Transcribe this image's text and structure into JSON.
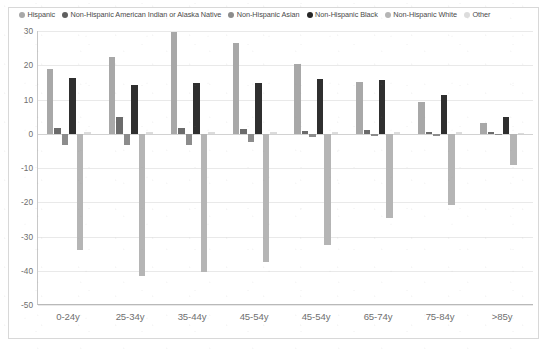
{
  "chart_data": {
    "type": "bar",
    "title": "",
    "subtitle": "",
    "xlabel": "",
    "ylabel": "",
    "ylim": [
      -50,
      30
    ],
    "yticks": [
      30,
      20,
      10,
      0,
      -10,
      -20,
      -30,
      -40,
      -50
    ],
    "ytick_labels": [
      "30",
      "20",
      "10",
      "0",
      "-10",
      "-20",
      "-30",
      "-40",
      "-50"
    ],
    "grid": true,
    "legend_position": "top",
    "categories": [
      "0-24y",
      "25-34y",
      "35-44y",
      "45-54y",
      "45-54y",
      "65-74y",
      "75-84y",
      ">85y"
    ],
    "series": [
      {
        "name": "Hispanic",
        "color": "#a8a8a8",
        "values": [
          19,
          22.5,
          29.8,
          26.5,
          20.3,
          15,
          9.2,
          3.2
        ]
      },
      {
        "name": "Non-Hispanic American Indian or Alaska Native",
        "color": "#6b6b6b",
        "values": [
          1.8,
          4.8,
          1.8,
          1.5,
          0.8,
          1.2,
          0.5,
          0.4
        ]
      },
      {
        "name": "Non-Hispanic Asian",
        "color": "#8c8c8c",
        "values": [
          -3.2,
          -3.2,
          -3.2,
          -2.4,
          -0.9,
          -0.8,
          -0.6,
          -0.5
        ]
      },
      {
        "name": "Non-Hispanic Black",
        "color": "#2f2f2f",
        "values": [
          16.4,
          14.2,
          14.8,
          14.8,
          16,
          15.6,
          11.3,
          5
        ]
      },
      {
        "name": "Non-Hispanic White",
        "color": "#b5b5b5",
        "values": [
          -33.8,
          -41.5,
          -40.5,
          -37.5,
          -32.5,
          -24.5,
          -20.8,
          -9.2
        ]
      },
      {
        "name": "Other",
        "color": "#dcdcdc",
        "values": [
          0.6,
          0.5,
          0.5,
          0.5,
          0.5,
          0.5,
          0.4,
          0.3
        ]
      }
    ]
  },
  "legend": {
    "items": [
      {
        "label": "Hispanic",
        "color": "#a8a8a8"
      },
      {
        "label": "Non-Hispanic American Indian or Alaska Native",
        "color": "#5f5f5f"
      },
      {
        "label": "Non-Hispanic Asian",
        "color": "#8c8c8c"
      },
      {
        "label": "Non-Hispanic Black",
        "color": "#262626"
      },
      {
        "label": "Non-Hispanic White",
        "color": "#b5b5b5"
      },
      {
        "label": "Other",
        "color": "#dcdcdc"
      }
    ]
  }
}
